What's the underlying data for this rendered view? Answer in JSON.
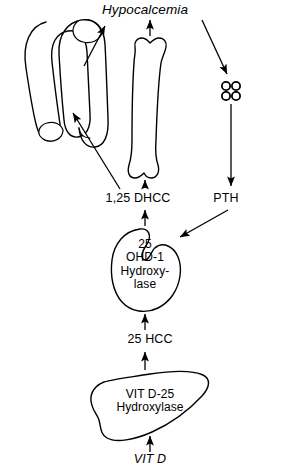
{
  "diagram": {
    "title_label": "Hypocalcemia",
    "nodes": {
      "hypocalcemia": "Hypocalcemia",
      "dhcc": "1,25 DHCC",
      "pth": "PTH",
      "hcc": "25 HCC",
      "vit_d": "VIT D"
    },
    "kidney_enzyme": {
      "line1": "25",
      "line2": "OHD-1",
      "line3": "Hydroxy-",
      "line4": "lase"
    },
    "liver_enzyme": {
      "line1": "VIT D-25",
      "line2": "Hydroxylase"
    },
    "organs": {
      "intestine": "intestine-icon",
      "bone": "bone-icon",
      "parathyroid": "parathyroid-glands-icon",
      "kidney": "kidney-icon",
      "liver": "liver-icon"
    },
    "colors": {
      "stroke": "#000000",
      "fill": "#ffffff",
      "background": "#ffffff"
    }
  }
}
